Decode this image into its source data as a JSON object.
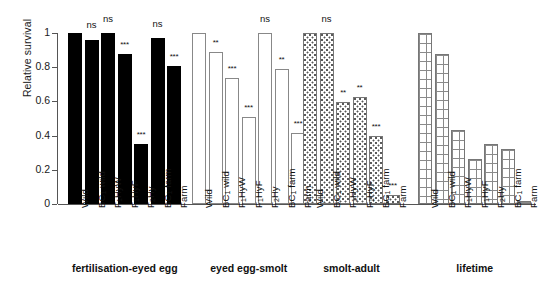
{
  "chart_data": {
    "type": "bar",
    "title": "",
    "xlabel": "",
    "ylabel": "Relative survival",
    "ylim": [
      0,
      1
    ],
    "yticks": [
      "0",
      "0.2",
      "0.4",
      "0.6",
      "0.8",
      "1"
    ],
    "ytick_values": [
      0,
      0.2,
      0.4,
      0.6,
      0.8,
      1
    ],
    "grid": false,
    "legend": "none",
    "categories": [
      "Wild",
      "BC₁ wild",
      "F₁HyW",
      "F₁HyF",
      "F₂Hy",
      "BC₁ farm",
      "Farm"
    ],
    "groups": [
      {
        "name": "fertilisation-eyed egg",
        "fill": "solid",
        "bars": [
          {
            "category": "Wild",
            "label_html": "Wild",
            "value": 1.0,
            "sig": ""
          },
          {
            "category": "BC1 wild",
            "label_html": "BC<sub>1</sub> wild",
            "value": 0.96,
            "sig": "ns"
          },
          {
            "category": "F1HyW",
            "label_html": "F<sub>1</sub>HyW",
            "value": 1.0,
            "sig": "ns"
          },
          {
            "category": "F1HyF",
            "label_html": "F<sub>1</sub>HyF",
            "value": 0.875,
            "sig": "***"
          },
          {
            "category": "F2Hy",
            "label_html": "F<sub>2</sub>Hy",
            "value": 0.35,
            "sig": "***"
          },
          {
            "category": "BC1 farm",
            "label_html": "BC<sub>1</sub> farm",
            "value": 0.97,
            "sig": "ns"
          },
          {
            "category": "Farm",
            "label_html": "Farm",
            "value": 0.805,
            "sig": "***"
          }
        ]
      },
      {
        "name": "eyed egg-smolt",
        "fill": "open",
        "bars": [
          {
            "category": "Wild",
            "label_html": "Wild",
            "value": 1.0,
            "sig": ""
          },
          {
            "category": "BC1 wild",
            "label_html": "BC<sub>1</sub> wild",
            "value": 0.89,
            "sig": "**"
          },
          {
            "category": "F1HyW",
            "label_html": "F<sub>1</sub>HyW",
            "value": 0.735,
            "sig": "***"
          },
          {
            "category": "F1HyF",
            "label_html": "F<sub>1</sub>HyF",
            "value": 0.51,
            "sig": "***"
          },
          {
            "category": "F2Hy",
            "label_html": "F<sub>2</sub>Hy",
            "value": 1.0,
            "sig": "ns"
          },
          {
            "category": "BC1 farm",
            "label_html": "BC<sub>1</sub> farm",
            "value": 0.79,
            "sig": "**"
          },
          {
            "category": "Farm",
            "label_html": "Farm",
            "value": 0.415,
            "sig": "***"
          }
        ]
      },
      {
        "name": "smolt-adult",
        "fill": "dots",
        "bars": [
          {
            "category": "Wild",
            "label_html": "Wild",
            "value": 1.0,
            "sig": ""
          },
          {
            "category": "BC1 wild",
            "label_html": "BC<sub>1</sub> wild",
            "value": 1.0,
            "sig": "ns"
          },
          {
            "category": "F1HyW",
            "label_html": "F<sub>1</sub>HyW",
            "value": 0.595,
            "sig": "**"
          },
          {
            "category": "F1HyF",
            "label_html": "F<sub>1</sub>HyF",
            "value": 0.625,
            "sig": "**"
          },
          {
            "category": "BC1 farm",
            "label_html": "BC<sub>1</sub> farm",
            "value": 0.4,
            "sig": "***"
          },
          {
            "category": "Farm",
            "label_html": "Farm",
            "value": 0.055,
            "sig": "***"
          }
        ]
      },
      {
        "name": "lifetime",
        "fill": "brick",
        "bars": [
          {
            "category": "Wild",
            "label_html": "Wild",
            "value": 1.0,
            "sig": ""
          },
          {
            "category": "BC1 wild",
            "label_html": "BC<sub>1</sub> wild",
            "value": 0.88,
            "sig": ""
          },
          {
            "category": "F1HyW",
            "label_html": "F<sub>1</sub>HyW",
            "value": 0.43,
            "sig": ""
          },
          {
            "category": "F1HyF",
            "label_html": "F<sub>1</sub>HyF",
            "value": 0.265,
            "sig": ""
          },
          {
            "category": "F2Hy",
            "label_html": "F<sub>2</sub>Hy",
            "value": 0.35,
            "sig": ""
          },
          {
            "category": "BC1 farm",
            "label_html": "BC<sub>1</sub> farm",
            "value": 0.32,
            "sig": ""
          },
          {
            "category": "Farm",
            "label_html": "Farm",
            "value": 0.02,
            "sig": ""
          }
        ]
      }
    ]
  },
  "colors": {
    "solid_bar": "#000000",
    "open_bar": "#ffffff",
    "axis": "#555555",
    "text": "#111111"
  }
}
